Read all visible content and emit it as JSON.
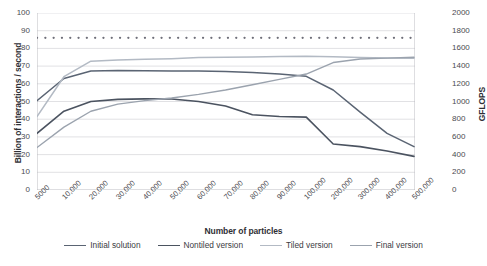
{
  "chart_data": {
    "type": "line",
    "title": "",
    "xlabel": "Number of particles",
    "ylabel": "Billion of interactions / second",
    "y2label": "GFLOPS",
    "categories": [
      "5000",
      "10,000",
      "20,000",
      "30,000",
      "40,000",
      "50,000",
      "60,000",
      "70,000",
      "80,000",
      "90,000",
      "100,000",
      "200,000",
      "300,000",
      "400,000",
      "500,000"
    ],
    "ylim": [
      0,
      100
    ],
    "yticks": [
      0,
      10,
      20,
      30,
      40,
      50,
      60,
      70,
      80,
      90,
      100
    ],
    "y2lim": [
      0,
      2000
    ],
    "y2ticks": [
      0,
      200,
      400,
      600,
      800,
      1000,
      1200,
      1400,
      1600,
      1800,
      2000
    ],
    "grid": true,
    "legend_position": "bottom",
    "series": [
      {
        "name": "Initial solution",
        "color": "#5a6473",
        "width": 1.5,
        "style": "solid",
        "values": [
          50.5,
          63.0,
          67.2,
          67.5,
          67.4,
          67.3,
          67.2,
          66.9,
          66.4,
          65.6,
          64.2,
          56.5,
          44.0,
          32.0,
          24.5
        ]
      },
      {
        "name": "Nontiled version",
        "color": "#4b5360",
        "width": 1.6,
        "style": "solid",
        "values": [
          32.0,
          44.5,
          50.0,
          51.2,
          51.5,
          51.4,
          50.0,
          47.5,
          42.5,
          41.5,
          41.2,
          26.0,
          24.5,
          22.0,
          19.0
        ]
      },
      {
        "name": "Tiled version",
        "color": "#b3bac4",
        "width": 1.5,
        "style": "solid",
        "values": [
          41.5,
          64.0,
          72.8,
          73.5,
          73.8,
          74.2,
          74.8,
          75.0,
          75.2,
          75.4,
          75.6,
          75.3,
          74.9,
          74.6,
          74.4
        ]
      },
      {
        "name": "Final version",
        "color": "#9ba3ae",
        "width": 1.4,
        "style": "solid",
        "values": [
          24.0,
          35.5,
          44.5,
          48.5,
          50.5,
          52.0,
          54.0,
          56.5,
          59.5,
          62.5,
          65.5,
          72.0,
          74.0,
          74.5,
          75.0
        ]
      },
      {
        "name": "Peak reference",
        "color": "#6f6f79",
        "width": 2.2,
        "style": "dotted",
        "values": [
          86,
          86,
          86,
          86,
          86,
          86,
          86,
          86,
          86,
          86,
          86,
          86,
          86,
          86,
          86
        ]
      }
    ]
  },
  "legend": {
    "items": [
      {
        "label": "Initial solution",
        "color": "#5a6473"
      },
      {
        "label": "Nontiled version",
        "color": "#4b5360"
      },
      {
        "label": "Tiled version",
        "color": "#b3bac4"
      },
      {
        "label": "Final version",
        "color": "#9ba3ae"
      }
    ]
  },
  "footer": {
    "mark": ""
  }
}
